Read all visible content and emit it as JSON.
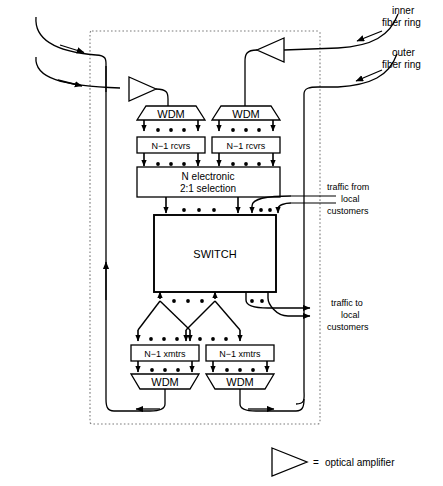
{
  "diagram": {
    "title_elements": {
      "switch_label": "SWITCH",
      "selection_line1": "N  electronic",
      "selection_line2": "2:1  selection",
      "rcvrs_left": "N−1  rcvrs",
      "rcvrs_right": "N−1  rcvrs",
      "xmtrs_left": "N−1  xmtrs",
      "xmtrs_right": "N−1  xmtrs",
      "wdm_top_left": "WDM",
      "wdm_top_right": "WDM",
      "wdm_bottom_left": "WDM",
      "wdm_bottom_right": "WDM"
    },
    "ring_labels": {
      "inner_line1": "inner",
      "inner_line2": "fiber ring",
      "outer_line1": "outer",
      "outer_line2": "fiber ring"
    },
    "traffic_labels": {
      "from_line1": "traffic from",
      "from_line2": "local",
      "from_line3": "customers",
      "to_line1": "traffic to",
      "to_line2": "local",
      "to_line3": "customers"
    },
    "legend": {
      "equals": "=",
      "text": "optical amplifier"
    },
    "colors": {
      "stroke": "#000000",
      "background": "#ffffff",
      "dashed_boundary": "#777777"
    }
  }
}
